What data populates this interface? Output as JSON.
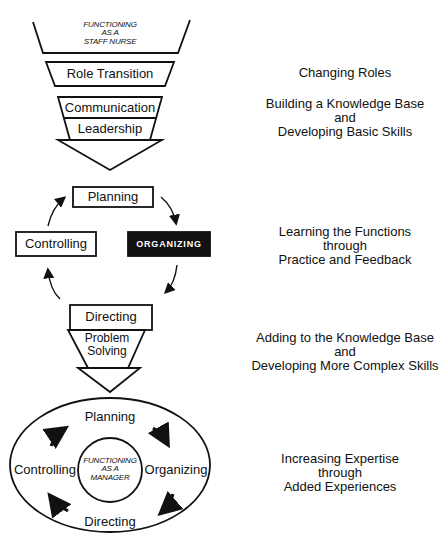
{
  "diagram": {
    "top_stage": {
      "funnel_label_lines": [
        "FUNCTIONING",
        "AS A",
        "STAFF NURSE"
      ],
      "role_transition": "Role Transition",
      "communication": "Communication",
      "leadership": "Leadership"
    },
    "learning_cycle": {
      "planning": "Planning",
      "organizing": "ORGANIZING",
      "directing": "Directing",
      "controlling": "Controlling"
    },
    "problem_solving_lines": [
      "Problem",
      "Solving"
    ],
    "manager_cycle": {
      "center_lines": [
        "FUNCTIONING",
        "AS A",
        "MANAGER"
      ],
      "planning": "Planning",
      "organizing": "Organizing",
      "directing": "Directing",
      "controlling": "Controlling"
    },
    "side_captions": [
      {
        "lines": [
          "Changing Roles"
        ]
      },
      {
        "lines": [
          "Building a Knowledge Base",
          "and",
          "Developing Basic Skills"
        ]
      },
      {
        "lines": [
          "Learning the Functions",
          "through",
          "Practice and Feedback"
        ]
      },
      {
        "lines": [
          "Adding to the Knowledge Base",
          "and",
          "Developing More Complex Skills"
        ]
      },
      {
        "lines": [
          "Increasing Expertise",
          "through",
          "Added Experiences"
        ]
      }
    ],
    "colors": {
      "ink": "#111111",
      "background": "#ffffff",
      "highlight_box": "#111111"
    }
  }
}
